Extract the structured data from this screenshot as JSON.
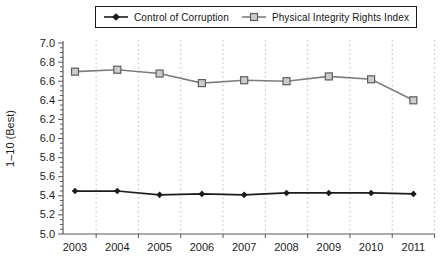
{
  "figure": {
    "background": "#ffffff",
    "axis_color": "#595959",
    "grid_color": "#bdbdbd",
    "text_color": "#1c1c1c"
  },
  "legend": {
    "items": [
      {
        "label": "Control of Corruption",
        "marker": "diamond"
      },
      {
        "label": "Physical Integrity Rights Index",
        "marker": "square"
      }
    ]
  },
  "chart_data": {
    "type": "line",
    "title": "",
    "xlabel": "",
    "ylabel": "1–10 (Best)",
    "ylim": [
      5.0,
      7.0
    ],
    "ytick_step": 0.2,
    "yminor_step": 0.05,
    "grid": "vertical-dotted",
    "legend_position": "top",
    "x": [
      2003,
      2004,
      2005,
      2006,
      2007,
      2008,
      2009,
      2010,
      2011
    ],
    "series": [
      {
        "name": "Control of Corruption",
        "marker": "diamond",
        "color": "#1c1c1c",
        "marker_fill": "#1c1c1c",
        "values": [
          5.45,
          5.45,
          5.41,
          5.42,
          5.41,
          5.43,
          5.43,
          5.43,
          5.42
        ]
      },
      {
        "name": "Physical Integrity Rights Index",
        "marker": "square",
        "color": "#7d7d7d",
        "marker_fill": "#cccccc",
        "marker_stroke": "#5e5e5e",
        "values": [
          6.7,
          6.72,
          6.68,
          6.58,
          6.61,
          6.6,
          6.65,
          6.62,
          6.4
        ]
      }
    ]
  }
}
